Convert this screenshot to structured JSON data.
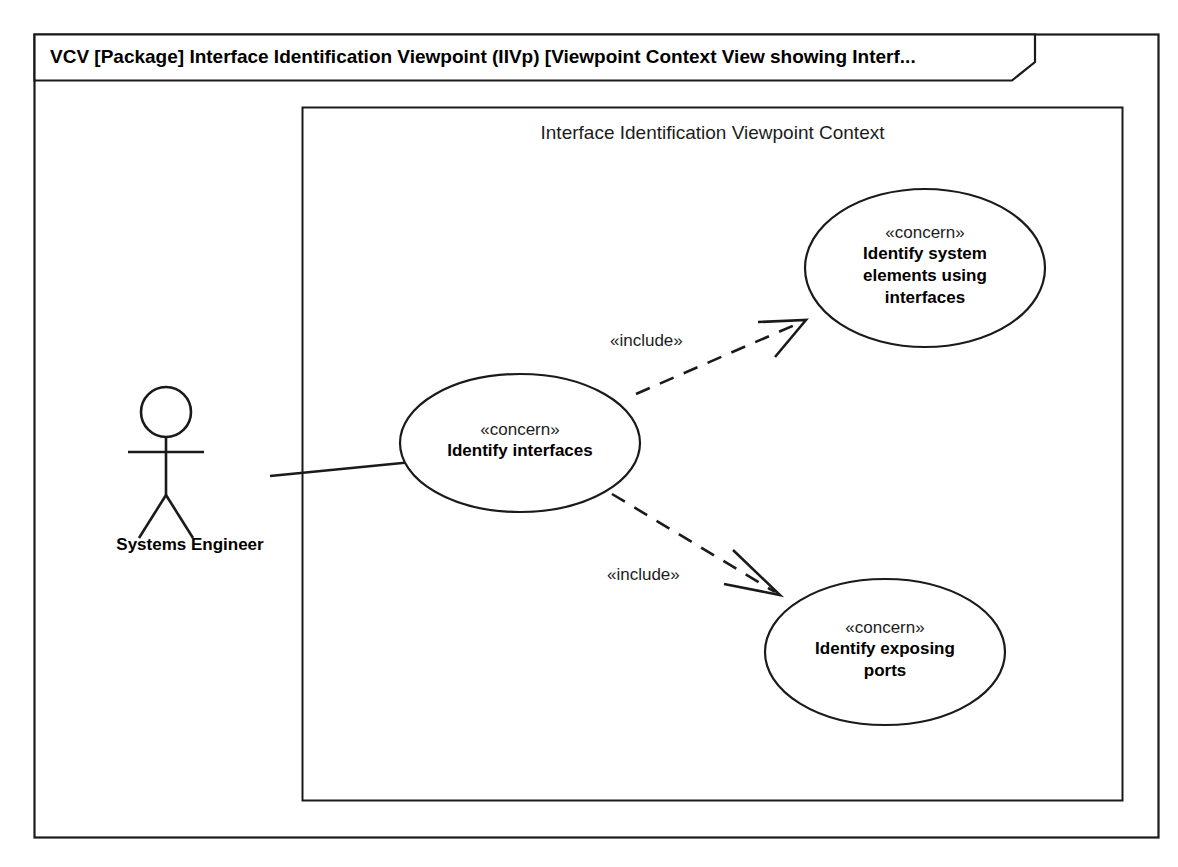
{
  "diagram": {
    "frame": {
      "title": "VCV [Package] Interface Identification Viewpoint (IIVp) [Viewpoint Context View showing Interf...",
      "kind": "VCV",
      "element_type": "Package"
    },
    "context_boundary": {
      "title": "Interface Identification Viewpoint Context"
    },
    "actors": [
      {
        "id": "systems-engineer",
        "label": "Systems Engineer"
      }
    ],
    "use_cases": [
      {
        "id": "identify-interfaces",
        "stereotype": "«concern»",
        "name_lines": [
          "Identify interfaces"
        ],
        "name": "Identify interfaces"
      },
      {
        "id": "identify-system-elements-using-interfaces",
        "stereotype": "«concern»",
        "name_lines": [
          "Identify system",
          "elements using",
          "interfaces"
        ],
        "name": "Identify system elements using interfaces"
      },
      {
        "id": "identify-exposing-ports",
        "stereotype": "«concern»",
        "name_lines": [
          "Identify exposing",
          "ports"
        ],
        "name": "Identify exposing ports"
      }
    ],
    "relationships": [
      {
        "id": "assoc-engineer-identify-interfaces",
        "type": "association",
        "label": "",
        "from": "systems-engineer",
        "to": "identify-interfaces",
        "style": "solid"
      },
      {
        "id": "include-top",
        "type": "include",
        "label": "«include»",
        "from": "identify-interfaces",
        "to": "identify-system-elements-using-interfaces",
        "style": "dashed"
      },
      {
        "id": "include-bottom",
        "type": "include",
        "label": "«include»",
        "from": "identify-interfaces",
        "to": "identify-exposing-ports",
        "style": "dashed"
      }
    ],
    "colors": {
      "stroke": "#1a1a1a",
      "text": "#000000",
      "background": "#ffffff"
    }
  }
}
